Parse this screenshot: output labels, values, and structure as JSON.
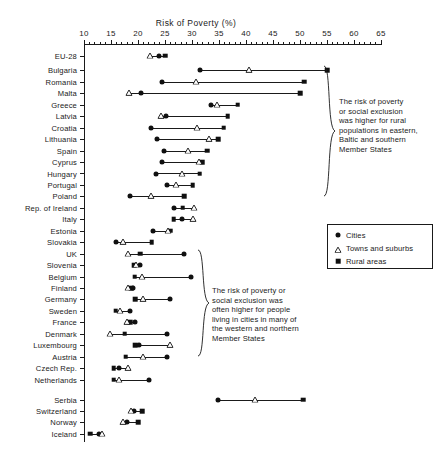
{
  "chart_data": {
    "type": "scatter",
    "orientation": "horizontal",
    "title": "Risk of Poverty (%)",
    "xlabel": "Risk of Poverty (%)",
    "ylabel": "",
    "xlim": [
      10,
      65
    ],
    "xticks": [
      10,
      15,
      20,
      25,
      30,
      35,
      40,
      45,
      50,
      55,
      60,
      65
    ],
    "minor_tick_step": 1,
    "grid": false,
    "legend_position": "right",
    "series": [
      {
        "name": "Cities",
        "marker": "circle",
        "key": "cities"
      },
      {
        "name": "Towns and suburbs",
        "marker": "triangle",
        "key": "towns"
      },
      {
        "name": "Rural areas",
        "marker": "square",
        "key": "rural"
      }
    ],
    "categories": [
      {
        "label": "EU-28",
        "cities": 23.8,
        "towns": 22.3,
        "rural": 25.0,
        "group": "eu28"
      },
      {
        "label": "Bulgaria",
        "cities": 31.5,
        "towns": 40.5,
        "rural": 55.0,
        "group": "upper"
      },
      {
        "label": "Romania",
        "cities": 24.5,
        "towns": 30.8,
        "rural": 50.8,
        "group": "upper"
      },
      {
        "label": "Malta",
        "cities": 20.5,
        "towns": 18.4,
        "rural": 50.0,
        "group": "upper"
      },
      {
        "label": "Greece",
        "cities": 33.5,
        "towns": 34.6,
        "rural": 38.5,
        "group": "upper"
      },
      {
        "label": "Latvia",
        "cities": 25.2,
        "towns": 24.2,
        "rural": 36.6,
        "group": "upper"
      },
      {
        "label": "Croatia",
        "cities": 22.4,
        "towns": 31.0,
        "rural": 35.9,
        "group": "upper"
      },
      {
        "label": "Lithuania",
        "cities": 23.6,
        "towns": 33.1,
        "rural": 34.8,
        "group": "upper"
      },
      {
        "label": "Spain",
        "cities": 24.8,
        "towns": 29.3,
        "rural": 32.8,
        "group": "upper"
      },
      {
        "label": "Cyprus",
        "cities": 24.4,
        "towns": 31.3,
        "rural": 31.9,
        "group": "upper"
      },
      {
        "label": "Hungary",
        "cities": 23.4,
        "towns": 28.2,
        "rural": 31.4,
        "group": "upper"
      },
      {
        "label": "Portugal",
        "cities": 25.3,
        "towns": 27.1,
        "rural": 30.1,
        "group": "upper"
      },
      {
        "label": "Poland",
        "cities": 18.6,
        "towns": 22.4,
        "rural": 28.6,
        "group": "upper"
      },
      {
        "label": "Rep. of Ireland",
        "cities": 26.6,
        "towns": 30.4,
        "rural": 28.3,
        "group": "upper"
      },
      {
        "label": "Italy",
        "cities": 28.1,
        "towns": 30.2,
        "rural": 26.6,
        "group": "upper"
      },
      {
        "label": "Estonia",
        "cities": 22.8,
        "towns": 25.5,
        "rural": 26.0,
        "group": "upper"
      },
      {
        "label": "Slovakia",
        "cities": 16.0,
        "towns": 17.3,
        "rural": 22.5,
        "group": "upper"
      },
      {
        "label": "UK",
        "cities": 28.6,
        "towns": 18.2,
        "rural": 20.4,
        "group": "lower"
      },
      {
        "label": "Slovenia",
        "cities": 20.4,
        "towns": 19.6,
        "rural": 19.3,
        "group": "lower"
      },
      {
        "label": "Belgium",
        "cities": 29.9,
        "towns": 20.7,
        "rural": 19.4,
        "group": "lower"
      },
      {
        "label": "Finland",
        "cities": 19.1,
        "towns": 18.2,
        "rural": 18.7,
        "group": "lower"
      },
      {
        "label": "Germany",
        "cities": 25.9,
        "towns": 21.0,
        "rural": 19.5,
        "group": "lower"
      },
      {
        "label": "Sweden",
        "cities": 18.5,
        "towns": 16.6,
        "rural": 15.9,
        "group": "lower"
      },
      {
        "label": "France",
        "cities": 19.4,
        "towns": 17.9,
        "rural": 18.6,
        "group": "lower"
      },
      {
        "label": "Denmark",
        "cities": 25.3,
        "towns": 14.8,
        "rural": 17.5,
        "group": "lower"
      },
      {
        "label": "Luxembourg",
        "cities": 20.2,
        "towns": 26.0,
        "rural": 19.5,
        "group": "lower"
      },
      {
        "label": "Austria",
        "cities": 25.4,
        "towns": 20.9,
        "rural": 17.7,
        "group": "lower"
      },
      {
        "label": "Czech Rep.",
        "cities": 16.5,
        "towns": 18.2,
        "rural": 15.5,
        "group": "lower"
      },
      {
        "label": "Netherlands",
        "cities": 22.1,
        "towns": 16.5,
        "rural": 15.5,
        "group": "lower"
      },
      {
        "label": "Serbia",
        "cities": 34.8,
        "towns": 41.6,
        "rural": 50.6,
        "group": "noneu"
      },
      {
        "label": "Switzerland",
        "cities": 19.3,
        "towns": 18.7,
        "rural": 20.8,
        "group": "noneu"
      },
      {
        "label": "Norway",
        "cities": 17.9,
        "towns": 17.3,
        "rural": 20.0,
        "group": "noneu"
      },
      {
        "label": "Iceland",
        "cities": 12.7,
        "towns": 13.4,
        "rural": 11.1,
        "group": "noneu"
      }
    ],
    "annotations": [
      {
        "id": "upper-note",
        "text": "The risk of poverty or social exclusion was higher for rural populations in eastern, Baltic and southern Member States"
      },
      {
        "id": "lower-note",
        "text": "The risk of poverty or social exclusion was often higher for people living in cities in many of the western and northern Member States"
      }
    ]
  },
  "legend": {
    "items": [
      {
        "label": "Cities",
        "marker": "circle"
      },
      {
        "label": "Towns and suburbs",
        "marker": "triangle"
      },
      {
        "label": "Rural areas",
        "marker": "square"
      }
    ]
  },
  "notes": {
    "upper": [
      "The risk of poverty",
      "or social exclusion",
      "was higher for rural",
      "populations in eastern,",
      "Baltic and southern",
      "Member States"
    ],
    "lower": [
      "The risk of poverty or",
      "social exclusion was",
      "often higher for people",
      "living in cities in many of",
      "the western and northern",
      "Member States"
    ]
  },
  "colors": {
    "ink": "#101010",
    "axis": "#1a1a1a",
    "background": "#ffffff"
  }
}
